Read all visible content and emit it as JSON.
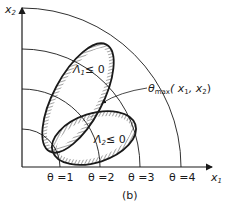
{
  "figure": {
    "caption": "(b)",
    "axes": {
      "x_label": "x",
      "x_sub": "1",
      "y_label": "x",
      "y_sub": "2"
    },
    "contours": [
      {
        "label": "θ =1"
      },
      {
        "label": "θ =2"
      },
      {
        "label": "θ =3"
      },
      {
        "label": "θ =4"
      }
    ],
    "regions": [
      {
        "name": "Λ",
        "sub": "1",
        "relation": "≤ 0"
      },
      {
        "name": "Λ",
        "sub": "2",
        "relation": "≤ 0"
      }
    ],
    "annotation": {
      "symbol": "θ",
      "sub": "max",
      "args": "( x",
      "args_sub1": "1",
      "args_mid": ", x",
      "args_sub2": "2",
      "args_end": ")"
    },
    "colors": {
      "ink": "#1a1a1a",
      "background": "#ffffff"
    }
  }
}
